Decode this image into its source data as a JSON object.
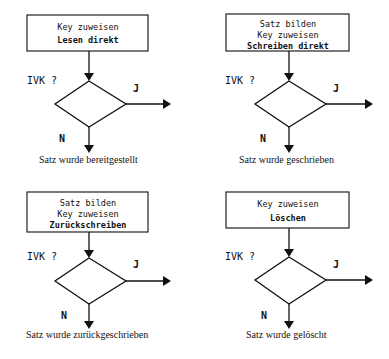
{
  "diagrams": [
    {
      "box_lines": [
        "Key zuweisen",
        "Lesen direkt"
      ],
      "bold_line_index": 1,
      "question": "IVK ?",
      "yes_label": "J",
      "no_label": "N",
      "caption": "Satz wurde bereitgestellt"
    },
    {
      "box_lines": [
        "Satz bilden",
        "Key zuweisen",
        "Schreiben direkt"
      ],
      "bold_line_index": 2,
      "question": "IVK ?",
      "yes_label": "J",
      "no_label": "N",
      "caption": "Satz wurde geschrieben"
    },
    {
      "box_lines": [
        "Satz bilden",
        "Key zuweisen",
        "Zurückschreiben"
      ],
      "bold_line_index": 2,
      "question": "IVK ?",
      "yes_label": "J",
      "no_label": "N",
      "caption": "Satz wurde zurückgeschrieben"
    },
    {
      "box_lines": [
        "Key zuweisen",
        "Löschen"
      ],
      "bold_line_index": 1,
      "question": "IVK ?",
      "yes_label": "J",
      "no_label": "N",
      "caption": "Satz wurde gelöscht"
    }
  ]
}
